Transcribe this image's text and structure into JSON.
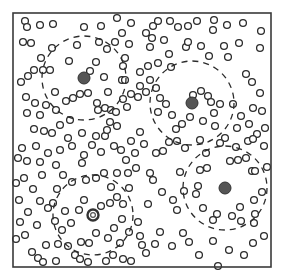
{
  "diagram": {
    "type": "particle-neighborhood-diagram",
    "canvas": {
      "width": 288,
      "height": 278,
      "background": "#ffffff"
    },
    "frame": {
      "x": 13,
      "y": 13,
      "width": 258,
      "height": 254,
      "stroke": "#3a3a3a",
      "stroke_width": 1.6
    },
    "colors": {
      "particle_stroke": "#2b2b2b",
      "particle_fill": "#ffffff",
      "center_fill": "#555555",
      "dashed_stroke": "#2b2b2b"
    },
    "particle_radius": 3.4,
    "neighborhoods": [
      {
        "name": "top-left",
        "cx": 84,
        "cy": 78,
        "r": 42,
        "center_style": "filled"
      },
      {
        "name": "top-right",
        "cx": 192,
        "cy": 103,
        "r": 42,
        "center_style": "filled"
      },
      {
        "name": "bottom-right",
        "cx": 225,
        "cy": 188,
        "r": 42,
        "center_style": "filled"
      },
      {
        "name": "bottom-left",
        "cx": 93,
        "cy": 215,
        "r": 40,
        "center_style": "bullseye"
      }
    ],
    "particles": [
      [
        25,
        21
      ],
      [
        27,
        27
      ],
      [
        40,
        25
      ],
      [
        53,
        24
      ],
      [
        84,
        27
      ],
      [
        101,
        26
      ],
      [
        117,
        18
      ],
      [
        131,
        23
      ],
      [
        122,
        33
      ],
      [
        115,
        42
      ],
      [
        23,
        42
      ],
      [
        31,
        43
      ],
      [
        52,
        48
      ],
      [
        77,
        45
      ],
      [
        99,
        42
      ],
      [
        107,
        49
      ],
      [
        129,
        44
      ],
      [
        41,
        58
      ],
      [
        43,
        70
      ],
      [
        34,
        70
      ],
      [
        28,
        76
      ],
      [
        21,
        82
      ],
      [
        50,
        70
      ],
      [
        69,
        61
      ],
      [
        90,
        71
      ],
      [
        96,
        62
      ],
      [
        104,
        77
      ],
      [
        108,
        92
      ],
      [
        122,
        80
      ],
      [
        125,
        58
      ],
      [
        123,
        66
      ],
      [
        125,
        80
      ],
      [
        26,
        97
      ],
      [
        27,
        113
      ],
      [
        35,
        103
      ],
      [
        40,
        115
      ],
      [
        46,
        105
      ],
      [
        55,
        92
      ],
      [
        56,
        110
      ],
      [
        66,
        101
      ],
      [
        73,
        98
      ],
      [
        80,
        94
      ],
      [
        88,
        93
      ],
      [
        98,
        110
      ],
      [
        97,
        103
      ],
      [
        105,
        108
      ],
      [
        111,
        110
      ],
      [
        116,
        112
      ],
      [
        123,
        99
      ],
      [
        127,
        107
      ],
      [
        131,
        94
      ],
      [
        138,
        97
      ],
      [
        140,
        86
      ],
      [
        140,
        72
      ],
      [
        146,
        33
      ],
      [
        153,
        26
      ],
      [
        158,
        21
      ],
      [
        170,
        21
      ],
      [
        178,
        27
      ],
      [
        188,
        26
      ],
      [
        197,
        21
      ],
      [
        214,
        20
      ],
      [
        213,
        30
      ],
      [
        227,
        25
      ],
      [
        243,
        23
      ],
      [
        261,
        31
      ],
      [
        152,
        38
      ],
      [
        150,
        47
      ],
      [
        164,
        40
      ],
      [
        169,
        54
      ],
      [
        158,
        63
      ],
      [
        186,
        47
      ],
      [
        188,
        42
      ],
      [
        171,
        67
      ],
      [
        201,
        46
      ],
      [
        209,
        56
      ],
      [
        224,
        46
      ],
      [
        228,
        57
      ],
      [
        239,
        43
      ],
      [
        260,
        48
      ],
      [
        246,
        74
      ],
      [
        252,
        82
      ],
      [
        260,
        93
      ],
      [
        253,
        108
      ],
      [
        262,
        111
      ],
      [
        265,
        128
      ],
      [
        257,
        134
      ],
      [
        248,
        141
      ],
      [
        148,
        66
      ],
      [
        150,
        80
      ],
      [
        146,
        92
      ],
      [
        156,
        88
      ],
      [
        160,
        98
      ],
      [
        158,
        112
      ],
      [
        166,
        104
      ],
      [
        172,
        115
      ],
      [
        176,
        129
      ],
      [
        182,
        124
      ],
      [
        190,
        117
      ],
      [
        193,
        95
      ],
      [
        201,
        91
      ],
      [
        208,
        96
      ],
      [
        211,
        102
      ],
      [
        203,
        121
      ],
      [
        214,
        113
      ],
      [
        220,
        104
      ],
      [
        215,
        126
      ],
      [
        233,
        104
      ],
      [
        225,
        138
      ],
      [
        237,
        128
      ],
      [
        241,
        116
      ],
      [
        249,
        124
      ],
      [
        200,
        140
      ],
      [
        206,
        153
      ],
      [
        220,
        143
      ],
      [
        236,
        147
      ],
      [
        253,
        139
      ],
      [
        264,
        146
      ],
      [
        267,
        167
      ],
      [
        252,
        171
      ],
      [
        230,
        161
      ],
      [
        238,
        160
      ],
      [
        246,
        158
      ],
      [
        255,
        171
      ],
      [
        240,
        207
      ],
      [
        254,
        200
      ],
      [
        262,
        192
      ],
      [
        255,
        214
      ],
      [
        241,
        221
      ],
      [
        254,
        223
      ],
      [
        232,
        216
      ],
      [
        217,
        214
      ],
      [
        213,
        220
      ],
      [
        203,
        208
      ],
      [
        196,
        194
      ],
      [
        198,
        186
      ],
      [
        200,
        170
      ],
      [
        207,
        168
      ],
      [
        180,
        172
      ],
      [
        184,
        191
      ],
      [
        173,
        200
      ],
      [
        177,
        210
      ],
      [
        162,
        192
      ],
      [
        148,
        204
      ],
      [
        150,
        173
      ],
      [
        153,
        180
      ],
      [
        156,
        153
      ],
      [
        163,
        151
      ],
      [
        169,
        142
      ],
      [
        177,
        141
      ],
      [
        185,
        148
      ],
      [
        144,
        144
      ],
      [
        140,
        132
      ],
      [
        131,
        141
      ],
      [
        135,
        153
      ],
      [
        126,
        160
      ],
      [
        121,
        150
      ],
      [
        117,
        173
      ],
      [
        128,
        173
      ],
      [
        136,
        168
      ],
      [
        129,
        188
      ],
      [
        123,
        204
      ],
      [
        122,
        219
      ],
      [
        129,
        232
      ],
      [
        140,
        236
      ],
      [
        138,
        222
      ],
      [
        142,
        245
      ],
      [
        146,
        253
      ],
      [
        155,
        244
      ],
      [
        160,
        232
      ],
      [
        172,
        246
      ],
      [
        183,
        233
      ],
      [
        189,
        242
      ],
      [
        199,
        255
      ],
      [
        213,
        241
      ],
      [
        229,
        250
      ],
      [
        244,
        255
      ],
      [
        253,
        243
      ],
      [
        264,
        236
      ],
      [
        218,
        266
      ],
      [
        105,
        136
      ],
      [
        96,
        136
      ],
      [
        107,
        130
      ],
      [
        110,
        122
      ],
      [
        117,
        126
      ],
      [
        114,
        146
      ],
      [
        101,
        152
      ],
      [
        92,
        145
      ],
      [
        84,
        155
      ],
      [
        82,
        133
      ],
      [
        70,
        120
      ],
      [
        60,
        125
      ],
      [
        52,
        133
      ],
      [
        44,
        131
      ],
      [
        34,
        129
      ],
      [
        22,
        148
      ],
      [
        18,
        158
      ],
      [
        27,
        161
      ],
      [
        36,
        146
      ],
      [
        48,
        153
      ],
      [
        60,
        150
      ],
      [
        68,
        138
      ],
      [
        72,
        146
      ],
      [
        82,
        163
      ],
      [
        86,
        180
      ],
      [
        96,
        178
      ],
      [
        104,
        173
      ],
      [
        111,
        187
      ],
      [
        117,
        197
      ],
      [
        110,
        203
      ],
      [
        101,
        206
      ],
      [
        84,
        200
      ],
      [
        79,
        210
      ],
      [
        71,
        223
      ],
      [
        62,
        230
      ],
      [
        68,
        246
      ],
      [
        58,
        244
      ],
      [
        46,
        245
      ],
      [
        38,
        258
      ],
      [
        32,
        252
      ],
      [
        43,
        262
      ],
      [
        56,
        261
      ],
      [
        75,
        255
      ],
      [
        80,
        259
      ],
      [
        88,
        262
      ],
      [
        106,
        261
      ],
      [
        113,
        255
      ],
      [
        123,
        259
      ],
      [
        131,
        261
      ],
      [
        96,
        233
      ],
      [
        108,
        238
      ],
      [
        114,
        228
      ],
      [
        120,
        243
      ],
      [
        89,
        243
      ],
      [
        81,
        242
      ],
      [
        55,
        221
      ],
      [
        48,
        208
      ],
      [
        40,
        201
      ],
      [
        33,
        189
      ],
      [
        24,
        178
      ],
      [
        19,
        200
      ],
      [
        28,
        212
      ],
      [
        25,
        235
      ],
      [
        37,
        225
      ],
      [
        16,
        239
      ],
      [
        20,
        222
      ],
      [
        16,
        183
      ],
      [
        63,
        175
      ],
      [
        72,
        182
      ],
      [
        57,
        189
      ],
      [
        53,
        203
      ],
      [
        65,
        211
      ],
      [
        42,
        175
      ],
      [
        40,
        162
      ],
      [
        56,
        165
      ]
    ]
  }
}
